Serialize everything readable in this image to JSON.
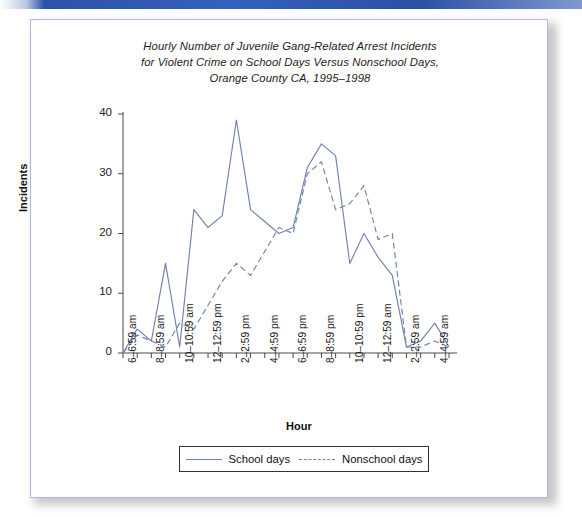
{
  "card": {
    "border_color": "#a9bcdd",
    "accent_bar_color": "#2d53a8"
  },
  "chart_data": {
    "type": "line",
    "title": "Hourly Number of Juvenile Gang-Related Arrest Incidents for Violent Crime on School Days Versus Nonschool Days, Orange County CA, 1995–1998",
    "title_lines": [
      "Hourly Number of Juvenile Gang-Related Arrest Incidents",
      "for Violent Crime on School Days Versus Nonschool Days,",
      "Orange County CA, 1995–1998"
    ],
    "xlabel": "Hour",
    "ylabel": "Incidents",
    "ylim": [
      0,
      40
    ],
    "yticks": [
      0,
      10,
      20,
      30,
      40
    ],
    "grid": false,
    "legend_position": "bottom",
    "line_color": "#6f82ae",
    "categories": [
      "6-6:59 am",
      "7-7:59 am",
      "8-8:59 am",
      "9-9:59 am",
      "10-10:59 am",
      "11-11:59 am",
      "12-12:59 pm",
      "1-1:59 pm",
      "2-2:59 pm",
      "3-3:59 pm",
      "4-4:59 pm",
      "5-5:59 pm",
      "6-6:59 pm",
      "7-7:59 pm",
      "8-8:59 pm",
      "9-9:59 pm",
      "10-10:59 pm",
      "11-11:59 pm",
      "12-12:59 am",
      "1-1:59 am",
      "2-2:59 am",
      "3-3:59 am",
      "4-4:59 am",
      "5-5:59 am"
    ],
    "xtick_labels": [
      "6–6:59 am",
      "8–8:59 am",
      "10–10:59 am",
      "12–12:59 pm",
      "2–2:59 pm",
      "4–4:59 pm",
      "6–6:59 pm",
      "8–8:59 pm",
      "10–10:59 pm",
      "12–12:59 am",
      "2–2:59 am",
      "4–4:59 am"
    ],
    "xtick_indices": [
      0,
      2,
      4,
      6,
      8,
      10,
      12,
      14,
      16,
      18,
      20,
      22
    ],
    "series": [
      {
        "name": "School days",
        "style": "solid",
        "values": [
          0,
          4,
          2,
          15,
          1,
          24,
          21,
          23,
          39,
          24,
          22,
          20,
          21,
          31,
          35,
          33,
          15,
          20,
          16,
          13,
          1,
          2,
          5,
          1
        ]
      },
      {
        "name": "Nonschool days",
        "style": "dashed",
        "values": [
          0,
          3,
          2,
          1,
          5,
          4,
          8,
          12,
          15,
          13,
          17,
          21,
          20,
          30,
          32,
          24,
          25,
          28,
          19,
          20,
          1,
          1,
          2,
          1
        ]
      }
    ]
  },
  "legend": {
    "entries": [
      {
        "label": "School days",
        "style": "solid"
      },
      {
        "label": "Nonschool days",
        "style": "dashed"
      }
    ]
  }
}
